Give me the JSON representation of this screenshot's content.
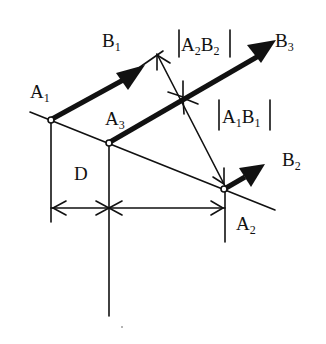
{
  "diagram": {
    "labels": {
      "A1": {
        "main": "A",
        "sub": "1"
      },
      "A2": {
        "main": "A",
        "sub": "2"
      },
      "A3": {
        "main": "A",
        "sub": "3"
      },
      "B1": {
        "main": "B",
        "sub": "1"
      },
      "B2": {
        "main": "B",
        "sub": "2"
      },
      "B3": {
        "main": "B",
        "sub": "3"
      },
      "D": "D",
      "dim_A2B2": {
        "bar": "|",
        "a": "A",
        "a_sub": "2",
        "b": "B",
        "b_sub": "2"
      },
      "dim_A1B1": {
        "bar": "|",
        "a": "A",
        "a_sub": "1",
        "b": "B",
        "b_sub": "1"
      }
    },
    "points": {
      "A1": [
        51,
        120
      ],
      "A3": [
        109,
        143
      ],
      "A2": [
        224,
        189
      ]
    },
    "colors": {
      "ink": "#111111",
      "background": "#ffffff"
    }
  }
}
